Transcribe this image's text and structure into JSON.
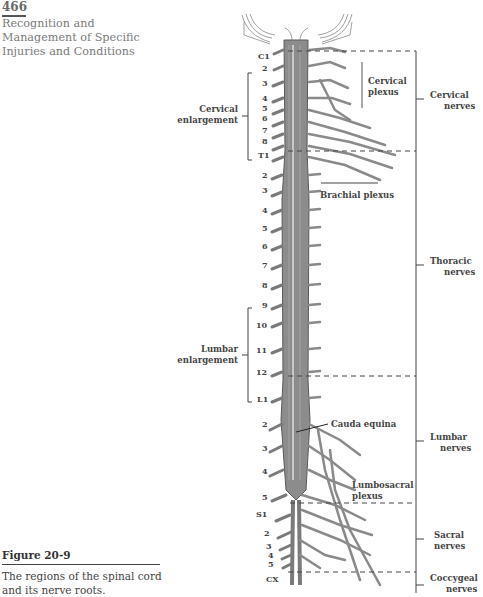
{
  "header": {
    "page_number": "466",
    "section_title": "Recognition and Management of Specific Injuries and Conditions"
  },
  "figure": {
    "label": "Figure 20-9",
    "caption": "The regions of the spinal cord and its nerve roots."
  },
  "diagram": {
    "colors": {
      "cord": "#8c8c8c",
      "cord_dark": "#5a5a5a",
      "nerve": "#9a9a9a",
      "line": "#555555",
      "text": "#444444"
    },
    "segment_labels": {
      "cervical": [
        "C1",
        "2",
        "3",
        "4",
        "5",
        "6",
        "7",
        "8"
      ],
      "thoracic": [
        "T1",
        "2",
        "3",
        "4",
        "5",
        "6",
        "7",
        "8",
        "9",
        "10",
        "11",
        "12"
      ],
      "lumbar": [
        "L1",
        "2",
        "3",
        "4",
        "5"
      ],
      "sacral": [
        "S1",
        "2",
        "3",
        "4",
        "5"
      ],
      "coccygeal": [
        "CX"
      ]
    },
    "left_labels": {
      "cervical_enlargement_1": "Cervical",
      "cervical_enlargement_2": "enlargement",
      "lumbar_enlargement_1": "Lumbar",
      "lumbar_enlargement_2": "enlargement"
    },
    "inner_labels": {
      "cervical_plexus_1": "Cervical",
      "cervical_plexus_2": "plexus",
      "brachial_plexus": "Brachial plexus",
      "cauda_equina": "Cauda equina",
      "lumbosacral_plexus_1": "Lumbosacral",
      "lumbosacral_plexus_2": "plexus"
    },
    "region_labels": {
      "cervical_1": "Cervical",
      "cervical_2": "nerves",
      "thoracic_1": "Thoracic",
      "thoracic_2": "nerves",
      "lumbar_1": "Lumbar",
      "lumbar_2": "nerves",
      "sacral_1": "Sacral",
      "sacral_2": "nerves",
      "coccygeal_1": "Coccygeal",
      "coccygeal_2": "nerves"
    }
  }
}
